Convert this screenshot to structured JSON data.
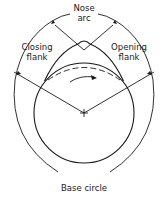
{
  "diagram": {
    "type": "cam-profile",
    "labels": {
      "nose_line1": "Nose",
      "nose_line2": "arc",
      "closing_line1": "Closing",
      "closing_line2": "flank",
      "opening_line1": "Opening",
      "opening_line2": "flank",
      "base": "Base circle"
    },
    "colors": {
      "stroke": "#1a1a1a",
      "background": "#ffffff"
    }
  }
}
